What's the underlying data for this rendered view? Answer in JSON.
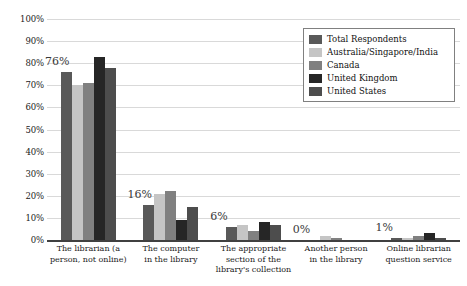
{
  "chart_data": {
    "type": "bar",
    "title": "",
    "subtitle": "",
    "xlabel": "",
    "ylabel": "",
    "ylim": [
      0,
      100
    ],
    "ytick_labels": [
      "100%",
      "90%",
      "80%",
      "70%",
      "60%",
      "50%",
      "40%",
      "30%",
      "20%",
      "10%",
      "0%"
    ],
    "ytick_values": [
      100,
      90,
      80,
      70,
      60,
      50,
      40,
      30,
      20,
      10,
      0
    ],
    "grid": true,
    "legend_position": "top-right",
    "categories": [
      "The librarian (a person, not online)",
      "The computer in the library",
      "The appropriate section of the library's collection",
      "Another person in the library",
      "Online librarian question service"
    ],
    "series": [
      {
        "name": "Total Respondents",
        "color": "#595959",
        "values": [
          76,
          16,
          6,
          0,
          1
        ]
      },
      {
        "name": "Australia/Singapore/India",
        "color": "#c5c5c5",
        "values": [
          70,
          21,
          7,
          2,
          1
        ]
      },
      {
        "name": "Canada",
        "color": "#808080",
        "values": [
          71,
          22,
          4,
          1,
          2
        ]
      },
      {
        "name": "United Kingdom",
        "color": "#262626",
        "values": [
          83,
          9,
          8,
          0,
          3
        ]
      },
      {
        "name": "United States",
        "color": "#4d4d4d",
        "values": [
          78,
          15,
          7,
          0,
          1
        ]
      }
    ],
    "data_labels": [
      {
        "category_index": 0,
        "series": "Total Respondents",
        "text": "76%"
      },
      {
        "category_index": 1,
        "series": "Total Respondents",
        "text": "16%"
      },
      {
        "category_index": 2,
        "series": "Total Respondents",
        "text": "6%"
      },
      {
        "category_index": 3,
        "series": "Total Respondents",
        "text": "0%"
      },
      {
        "category_index": 4,
        "series": "Total Respondents",
        "text": "1%"
      }
    ]
  },
  "legend": {
    "items": [
      {
        "label": "Total Respondents",
        "color": "#595959"
      },
      {
        "label": "Australia/Singapore/India",
        "color": "#c5c5c5"
      },
      {
        "label": "Canada",
        "color": "#808080"
      },
      {
        "label": "United Kingdom",
        "color": "#262626"
      },
      {
        "label": "United States",
        "color": "#4d4d4d"
      }
    ]
  },
  "axis": {
    "y_labels": [
      "100%",
      "90%",
      "80%",
      "70%",
      "60%",
      "50%",
      "40%",
      "30%",
      "20%",
      "10%",
      "0%"
    ],
    "x_labels": [
      "The librarian (a\nperson, not online)",
      "The computer\nin the library",
      "The appropriate\nsection of the\nlibrary's collection",
      "Another person\nin the library",
      "Online librarian\nquestion service"
    ]
  }
}
